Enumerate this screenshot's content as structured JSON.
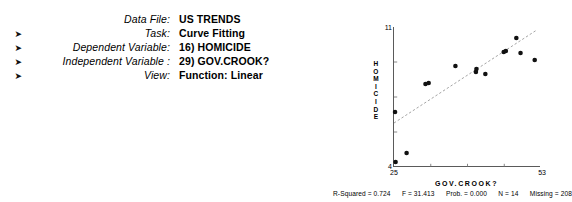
{
  "panel": {
    "rows": [
      {
        "arrow": "",
        "label": "Data File:",
        "value": "US TRENDS"
      },
      {
        "arrow": "➤",
        "label": "Task:",
        "value": "Curve Fitting"
      },
      {
        "arrow": "➤",
        "label": "Dependent Variable:",
        "value": "16) HOMICIDE"
      },
      {
        "arrow": "➤",
        "label": "Independent Variable :",
        "value": "29) GOV.CROOK?"
      },
      {
        "arrow": "➤",
        "label": "View:",
        "value": "Function: Linear"
      }
    ]
  },
  "chart_data": {
    "type": "scatter",
    "title": "",
    "xlabel": "GOV.CROOK?",
    "ylabel": "HOMICIDE",
    "ylabel_letters": [
      "H",
      "O",
      "M",
      "I",
      "C",
      "I",
      "D",
      "E"
    ],
    "xlim": [
      25,
      53
    ],
    "ylim": [
      4,
      11
    ],
    "xticks": [
      25,
      53
    ],
    "yticks": [
      4,
      11
    ],
    "xtick_labels": [
      "25",
      "53"
    ],
    "ytick_labels": [
      "4",
      "11"
    ],
    "grid": false,
    "legend": "none",
    "points": [
      {
        "x": 25.3,
        "y": 4.25
      },
      {
        "x": 25.2,
        "y": 6.75
      },
      {
        "x": 27.4,
        "y": 4.7
      },
      {
        "x": 31.0,
        "y": 8.15
      },
      {
        "x": 31.6,
        "y": 8.2
      },
      {
        "x": 36.7,
        "y": 9.05
      },
      {
        "x": 40.6,
        "y": 8.75
      },
      {
        "x": 40.7,
        "y": 8.9
      },
      {
        "x": 42.4,
        "y": 8.65
      },
      {
        "x": 45.9,
        "y": 9.75
      },
      {
        "x": 46.3,
        "y": 9.8
      },
      {
        "x": 48.3,
        "y": 10.45
      },
      {
        "x": 49.1,
        "y": 9.7
      },
      {
        "x": 51.8,
        "y": 9.35
      }
    ],
    "fit_line": {
      "style": "dashed",
      "x0": 25.0,
      "y0": 6.2,
      "x1": 52.2,
      "y1": 10.85
    }
  },
  "stats": {
    "items": [
      "R-Squared = 0.724",
      "F = 31.413",
      "Prob. = 0.000",
      "N = 14",
      "Missing = 208"
    ]
  }
}
